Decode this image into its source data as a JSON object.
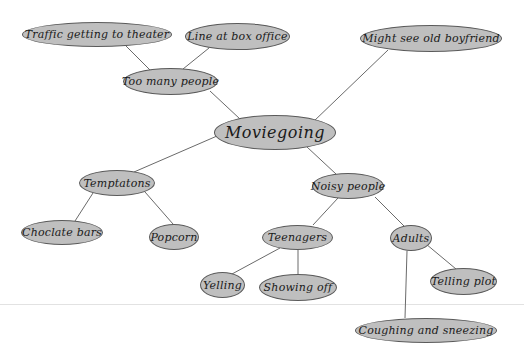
{
  "diagram": {
    "title": "Moviegoing",
    "colors": {
      "node_fill": "#bfbfbf",
      "node_border": "#5a5a5a",
      "link": "#6a6a6a",
      "rule": "#e2e2e2"
    },
    "nodes": [
      {
        "id": "moviegoing",
        "label": "Moviegoing",
        "x": 214,
        "y": 115,
        "w": 122,
        "h": 35,
        "root": true
      },
      {
        "id": "too-many-people",
        "label": "Too many people",
        "x": 123,
        "y": 68,
        "w": 95,
        "h": 27
      },
      {
        "id": "traffic",
        "label": "Traffic getting to theater",
        "x": 22,
        "y": 22,
        "w": 150,
        "h": 25
      },
      {
        "id": "line-box-office",
        "label": "Line at box office",
        "x": 185,
        "y": 23,
        "w": 105,
        "h": 27
      },
      {
        "id": "old-boyfriend",
        "label": "Might see old boyfriend",
        "x": 360,
        "y": 25,
        "w": 142,
        "h": 27
      },
      {
        "id": "temptations",
        "label": "Temptatons",
        "x": 79,
        "y": 170,
        "w": 76,
        "h": 26
      },
      {
        "id": "chocolate-bars",
        "label": "Choclate bars",
        "x": 21,
        "y": 220,
        "w": 82,
        "h": 25
      },
      {
        "id": "popcorn",
        "label": "Popcorn",
        "x": 149,
        "y": 224,
        "w": 50,
        "h": 26
      },
      {
        "id": "noisy-people",
        "label": "Noisy people",
        "x": 312,
        "y": 173,
        "w": 72,
        "h": 26
      },
      {
        "id": "teenagers",
        "label": "Teenagers",
        "x": 262,
        "y": 225,
        "w": 71,
        "h": 25
      },
      {
        "id": "adults",
        "label": "Adults",
        "x": 390,
        "y": 225,
        "w": 42,
        "h": 26
      },
      {
        "id": "yelling",
        "label": "Yelling",
        "x": 200,
        "y": 272,
        "w": 45,
        "h": 26
      },
      {
        "id": "showing-off",
        "label": "Showing off",
        "x": 259,
        "y": 274,
        "w": 78,
        "h": 27
      },
      {
        "id": "telling-plot",
        "label": "Telling plot",
        "x": 430,
        "y": 268,
        "w": 67,
        "h": 27
      },
      {
        "id": "coughing-sneezing",
        "label": "Coughing and sneezing",
        "x": 355,
        "y": 318,
        "w": 142,
        "h": 25
      }
    ],
    "links": [
      {
        "from": "moviegoing",
        "to": "too-many-people",
        "x1": 240,
        "y1": 119,
        "x2": 210,
        "y2": 91
      },
      {
        "from": "too-many-people",
        "to": "traffic",
        "x1": 150,
        "y1": 70,
        "x2": 126,
        "y2": 46
      },
      {
        "from": "too-many-people",
        "to": "line-box-office",
        "x1": 183,
        "y1": 69,
        "x2": 209,
        "y2": 48
      },
      {
        "from": "moviegoing",
        "to": "old-boyfriend",
        "x1": 313,
        "y1": 122,
        "x2": 388,
        "y2": 50
      },
      {
        "from": "moviegoing",
        "to": "temptations",
        "x1": 217,
        "y1": 136,
        "x2": 134,
        "y2": 172
      },
      {
        "from": "moviegoing",
        "to": "noisy-people",
        "x1": 307,
        "y1": 147,
        "x2": 336,
        "y2": 174
      },
      {
        "from": "temptations",
        "to": "chocolate-bars",
        "x1": 93,
        "y1": 193,
        "x2": 75,
        "y2": 221
      },
      {
        "from": "temptations",
        "to": "popcorn",
        "x1": 145,
        "y1": 192,
        "x2": 173,
        "y2": 224
      },
      {
        "from": "noisy-people",
        "to": "teenagers",
        "x1": 338,
        "y1": 198,
        "x2": 313,
        "y2": 225
      },
      {
        "from": "noisy-people",
        "to": "adults",
        "x1": 375,
        "y1": 197,
        "x2": 404,
        "y2": 226
      },
      {
        "from": "teenagers",
        "to": "yelling",
        "x1": 280,
        "y1": 248,
        "x2": 232,
        "y2": 274
      },
      {
        "from": "teenagers",
        "to": "showing-off",
        "x1": 298,
        "y1": 250,
        "x2": 298,
        "y2": 274
      },
      {
        "from": "adults",
        "to": "telling-plot",
        "x1": 426,
        "y1": 244,
        "x2": 456,
        "y2": 269
      },
      {
        "from": "adults",
        "to": "coughing-sneezing",
        "x1": 407,
        "y1": 251,
        "x2": 405,
        "y2": 318
      }
    ],
    "rule_y": 304
  }
}
